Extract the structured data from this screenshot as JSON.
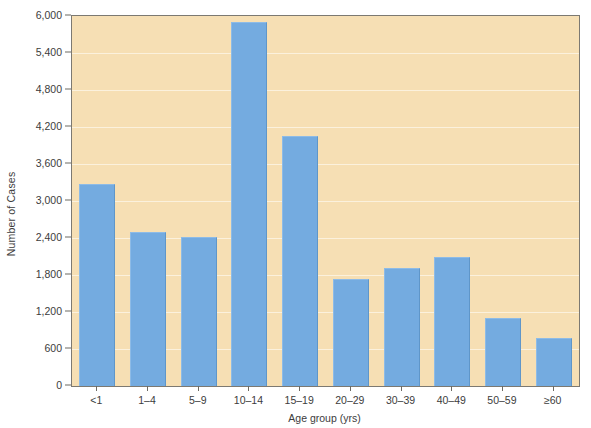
{
  "chart_data": {
    "type": "bar",
    "title": "",
    "subtitle": "",
    "xlabel": "Age group (yrs)",
    "ylabel": "Number of Cases",
    "categories": [
      "<1",
      "1–4",
      "5–9",
      "10–14",
      "15–19",
      "20–29",
      "30–39",
      "40–49",
      "50–59",
      "≥60"
    ],
    "values": [
      3280,
      2490,
      2420,
      5900,
      4050,
      1730,
      1910,
      2100,
      1110,
      780
    ],
    "ylim": [
      0,
      6000
    ],
    "ytick_values": [
      0,
      600,
      1200,
      1800,
      2400,
      3000,
      3600,
      4200,
      4800,
      5400,
      6000
    ],
    "ytick_labels": [
      "0",
      "600",
      "1,200",
      "1,800",
      "2,400",
      "3,000",
      "3,600",
      "4,200",
      "4,800",
      "5,400",
      "6,000"
    ],
    "grid": true,
    "legend": null,
    "legend_position": "none",
    "colors": {
      "bar": "#74abe0",
      "bar_highlight": "#8dbbe7",
      "bar_shadow": "#5f96c9",
      "plot_background": "#f6dfb4",
      "gridline": "#ffffff",
      "axis": "#6d6a63",
      "text": "#3c3c3c",
      "page_background": "#ffffff"
    }
  }
}
